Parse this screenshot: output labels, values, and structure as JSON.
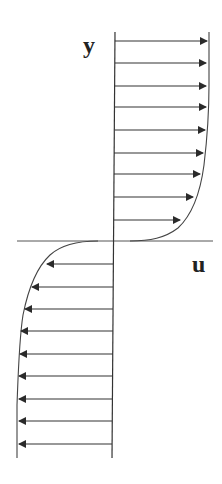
{
  "diagram": {
    "title": "",
    "labels": {
      "y_axis": "y",
      "x_axis": "u"
    },
    "colors": {
      "stroke": "#333333",
      "arrow": "#2a2a2a",
      "background": "#ffffff"
    }
  }
}
